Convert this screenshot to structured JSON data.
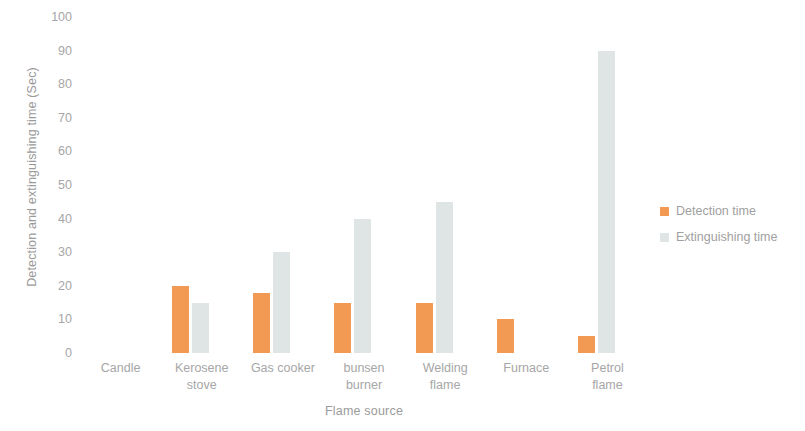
{
  "chart_data": {
    "type": "bar",
    "title": "",
    "xlabel": "Flame source",
    "ylabel": "Detection and extinguishing time (Sec)",
    "categories": [
      "Candle",
      "Kerosene stove",
      "Gas cooker",
      "bunsen burner",
      "Welding flame",
      "Furnace",
      "Petrol flame"
    ],
    "category_lines": [
      [
        "Candle"
      ],
      [
        "Kerosene",
        "stove"
      ],
      [
        "Gas cooker"
      ],
      [
        "bunsen",
        "burner"
      ],
      [
        "Welding",
        "flame"
      ],
      [
        "Furnace"
      ],
      [
        "Petrol",
        "flame"
      ]
    ],
    "series": [
      {
        "name": "Detection time",
        "color": "#F29A53",
        "values": [
          0,
          20,
          18,
          15,
          15,
          10,
          5
        ]
      },
      {
        "name": "Extinguishing time",
        "color": "#DFE4E5",
        "values": [
          0,
          15,
          30,
          40,
          45,
          0,
          90
        ]
      }
    ],
    "ylim": [
      0,
      100
    ],
    "yticks": [
      100,
      90,
      80,
      70,
      60,
      50,
      40,
      30,
      20,
      10,
      0
    ],
    "ytick_labels": [
      "100",
      "90",
      "80",
      "70",
      "60",
      "50",
      "40",
      "30",
      "20",
      "10",
      "0"
    ],
    "grid": false,
    "legend_position": "right"
  },
  "legend": {
    "items": [
      {
        "label": "Detection time",
        "color": "#F29A53",
        "marker": "square-swatch-icon"
      },
      {
        "label": "Extinguishing time",
        "color": "#DFE4E5",
        "marker": "square-swatch-icon"
      }
    ]
  },
  "artifact": {
    "glyph": ""
  }
}
